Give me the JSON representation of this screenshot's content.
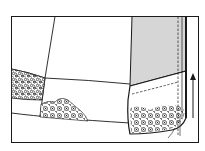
{
  "figure": {
    "description": "Sewing illustration: pieced quilt/skirt panel with floral print patches and a folded, shaded binding strip on the right, with an upward arrow indicating direction",
    "colors": {
      "background": "#ffffff",
      "line": "#1a1a1a",
      "shaded_fabric": "#d6d6d6",
      "floral_print": "#2a2a2a"
    },
    "parts": {
      "frame": "frame",
      "left_panel": "pieced-panel",
      "floral_patch_left": "floral-patch-left",
      "floral_patch_bottom": "floral-patch-bottom",
      "shaded_strip": "shaded-fabric-strip",
      "folded_hem": "folded-hem",
      "stitch_lines": "dashed-stitching",
      "arrow": "direction-arrow-up"
    }
  }
}
